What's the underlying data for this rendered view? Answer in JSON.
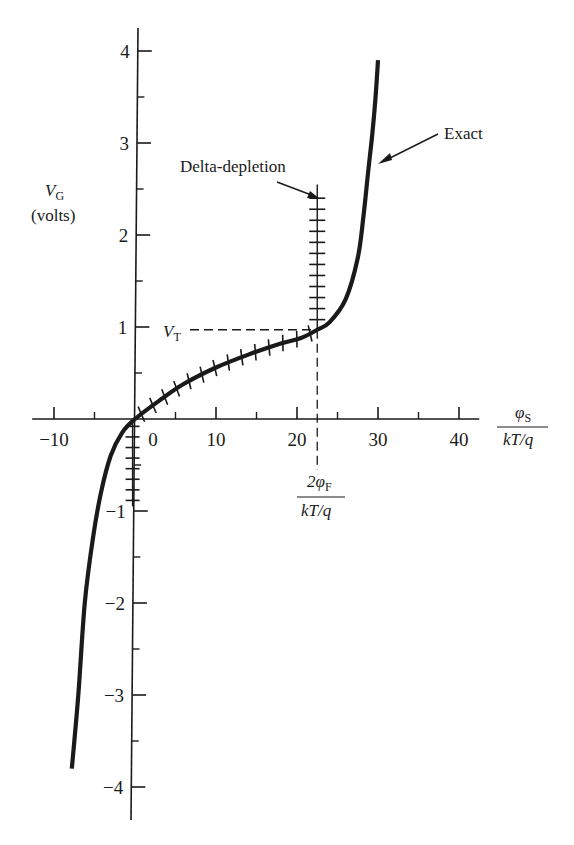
{
  "chart_data": {
    "type": "line",
    "title": "",
    "xlabel": "φS / (kT/q)",
    "xlabel_parts": {
      "numerator": "φ",
      "numerator_sub": "S",
      "denominator": "kT/q"
    },
    "ylabel": "VG (volts)",
    "ylabel_parts": {
      "main": "V",
      "sub": "G",
      "unit": "(volts)"
    },
    "xlim": [
      -12,
      42
    ],
    "ylim": [
      -4.3,
      4.3
    ],
    "x_ticks_major": [
      -10,
      0,
      10,
      20,
      30,
      40
    ],
    "x_tick_labels": [
      "−10",
      "0",
      "10",
      "20",
      "30",
      "40"
    ],
    "x_ticks_minor": [
      -5,
      5,
      15,
      25,
      35
    ],
    "y_ticks_major": [
      4,
      3,
      2,
      1,
      -1,
      -2,
      -3,
      -4
    ],
    "y_tick_labels": [
      "4",
      "3",
      "2",
      "1",
      "−1",
      "−2",
      "−3",
      "−4"
    ],
    "y_ticks_minor": [
      3.5,
      2.5,
      1.5,
      0.5,
      -0.5,
      -1.5,
      -2.5,
      -3.5
    ],
    "grid": false,
    "legend": "none (inline annotations)",
    "series": [
      {
        "name": "Exact",
        "style": "solid thick",
        "x": [
          -7.8,
          -7.0,
          -6.2,
          -5.2,
          -4.2,
          -3.0,
          -1.6,
          0,
          3,
          6,
          10,
          14,
          18,
          20.5,
          22.5,
          24,
          26,
          27.5,
          28.2,
          28.8,
          29.3,
          29.7,
          30.0
        ],
        "y": [
          -3.8,
          -3.0,
          -2.0,
          -1.3,
          -0.8,
          -0.4,
          -0.15,
          0,
          0.2,
          0.38,
          0.56,
          0.7,
          0.82,
          0.88,
          0.97,
          1.05,
          1.3,
          1.75,
          2.2,
          2.7,
          3.1,
          3.5,
          3.9
        ]
      },
      {
        "name": "Delta-depletion",
        "style": "hatched",
        "x": [
          -0.3,
          -0.3,
          0,
          3,
          6,
          10,
          14,
          18,
          20.5,
          22.5,
          22.5
        ],
        "y": [
          -0.95,
          0,
          0,
          0.2,
          0.38,
          0.56,
          0.7,
          0.82,
          0.88,
          0.97,
          2.55
        ]
      }
    ],
    "annotations": [
      {
        "text": "Exact",
        "points_to": "Exact curve near VG≈2.8"
      },
      {
        "text": "Delta-depletion",
        "points_to": "vertical hatched segment at φS≈2φF"
      },
      {
        "text": "VT",
        "x": 0,
        "y": 0.97,
        "note": "threshold voltage, dashed horizontal to curve"
      },
      {
        "text": "2φF / (kT/q)",
        "x": 22.5,
        "note": "dashed vertical below axis"
      }
    ]
  },
  "labels": {
    "y_axis_main": "V",
    "y_axis_sub": "G",
    "y_axis_unit": "(volts)",
    "x_axis_num": "φ",
    "x_axis_num_sub": "S",
    "x_axis_den": "kT/q",
    "vt_main": "V",
    "vt_sub": "T",
    "phif_num_prefix": "2φ",
    "phif_num_sub": "F",
    "phif_den": "kT/q",
    "exact": "Exact",
    "delta": "Delta-depletion"
  },
  "colors": {
    "ink": "#1a1a1a",
    "background": "#ffffff"
  }
}
